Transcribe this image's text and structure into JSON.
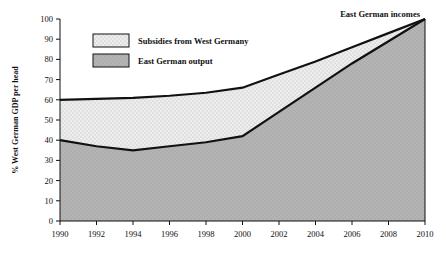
{
  "chart_data": {
    "type": "area",
    "title": "",
    "subtitle": "",
    "xlabel": "",
    "ylabel": "% West German GDP per head",
    "x": [
      1990,
      1992,
      1994,
      1996,
      1998,
      2000,
      2002,
      2004,
      2006,
      2008,
      2010
    ],
    "xlim": [
      1990,
      2010
    ],
    "ylim": [
      0,
      100
    ],
    "grid": false,
    "legend_position": "inside-top-left",
    "series": [
      {
        "name": "East German output",
        "fill_color": "#b3b3b3",
        "values": [
          40,
          37,
          35,
          37,
          39,
          42,
          54,
          66,
          78,
          89,
          100
        ]
      },
      {
        "name": "East German incomes",
        "fill_color": "#e9e9e9",
        "values": [
          60,
          60.5,
          61,
          62,
          63.5,
          66,
          72.5,
          79,
          86,
          93,
          100
        ]
      }
    ],
    "band_label": "Subsidies from West Germany",
    "annotations": [
      {
        "text": "East German incomes",
        "x": 2008,
        "y": 100
      }
    ],
    "yticks": [
      0,
      10,
      20,
      30,
      40,
      50,
      60,
      70,
      80,
      90,
      100
    ],
    "ytick_labels": [
      "0",
      "10",
      "20",
      "30",
      "40",
      "50",
      "60",
      "70",
      "80",
      "90",
      "100"
    ],
    "xticks": [
      1990,
      1992,
      1994,
      1996,
      1998,
      2000,
      2002,
      2004,
      2006,
      2008,
      2010
    ],
    "xtick_labels": [
      "1990",
      "1992",
      "1994",
      "1996",
      "1998",
      "2000",
      "2002",
      "2004",
      "2006",
      "2008",
      "2010"
    ]
  },
  "legend": {
    "items": [
      {
        "label": "Subsidies from West Germany",
        "swatch": "#e9e9e9"
      },
      {
        "label": "East German output",
        "swatch": "#b3b3b3"
      }
    ]
  },
  "axes": {
    "y_title": "% West German GDP per head"
  },
  "annotation": {
    "incomes_label": "East German incomes"
  },
  "colors": {
    "axis": "#111111",
    "line": "#111111",
    "subsidies_fill": "#e9e9e9",
    "output_fill": "#b3b3b3",
    "background": "#ffffff"
  }
}
